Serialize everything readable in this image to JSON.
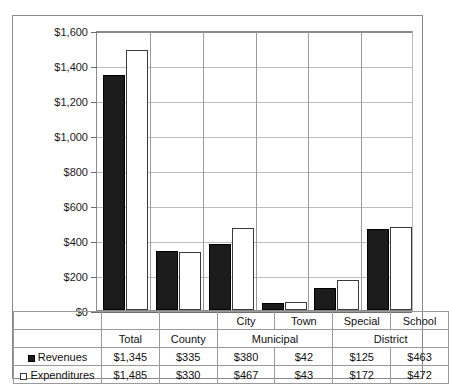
{
  "chart_data": {
    "type": "bar",
    "title": "",
    "xlabel": "",
    "ylabel": "",
    "ylim": [
      0,
      1600
    ],
    "ytick_step": 200,
    "grid": true,
    "legend_position": "table-row-labels",
    "categories": [
      "Total",
      "County",
      "City",
      "Town",
      "Special",
      "School"
    ],
    "group_headers": [
      {
        "label": "Total",
        "span": 1
      },
      {
        "label": "County",
        "span": 1
      },
      {
        "label": "Municipal",
        "span": 2
      },
      {
        "label": "District",
        "span": 2
      }
    ],
    "ytick_labels": [
      "$1,600",
      "$1,400",
      "$1,200",
      "$1,000",
      "$800",
      "$600",
      "$400",
      "$200",
      "$0"
    ],
    "ytick_values": [
      1600,
      1400,
      1200,
      1000,
      800,
      600,
      400,
      200,
      0
    ],
    "series": [
      {
        "name": "Revenues",
        "marker": "filled-square",
        "color": "#1c1c1c",
        "values": [
          1345,
          335,
          380,
          42,
          125,
          463
        ],
        "labels": [
          "$1,345",
          "$335",
          "$380",
          "$42",
          "$125",
          "$463"
        ]
      },
      {
        "name": "Expenditures",
        "marker": "hollow-square",
        "color": "#ffffff",
        "values": [
          1485,
          330,
          467,
          43,
          172,
          472
        ],
        "labels": [
          "$1,485",
          "$330",
          "$467",
          "$43",
          "$172",
          "$472"
        ]
      }
    ]
  },
  "table": {
    "corner_label": "",
    "row_labels": [
      "Revenues",
      "Expenditures"
    ]
  }
}
